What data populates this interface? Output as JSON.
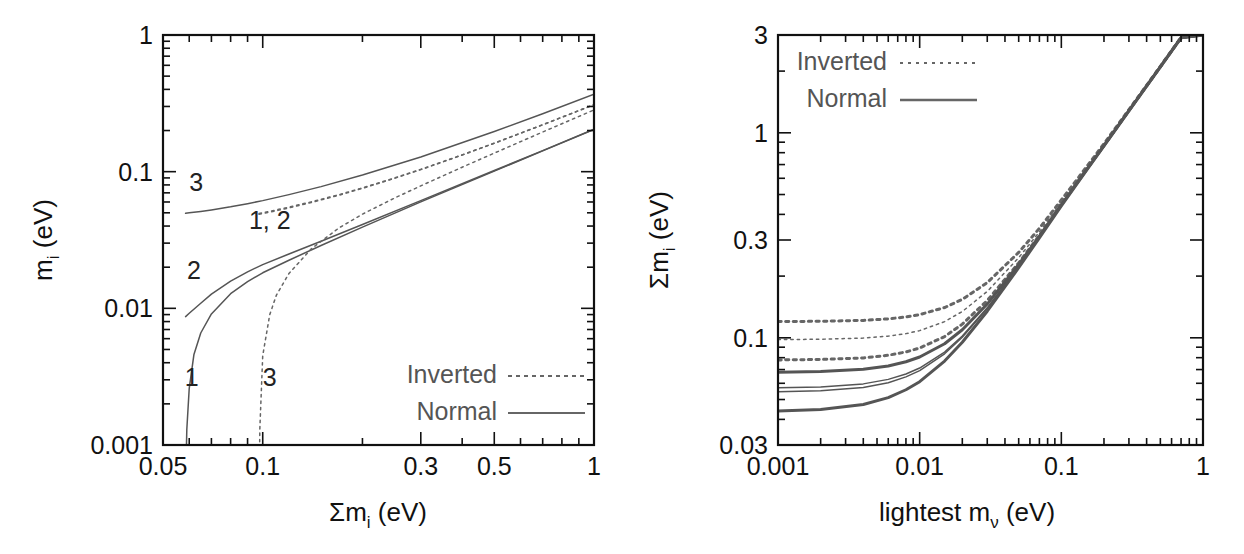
{
  "figure": {
    "background": "#ffffff",
    "panel_count": 2
  },
  "colors": {
    "axis": "#111111",
    "normal_curve": "#555555",
    "inverted_curve": "#666666",
    "legend_text": "#555555",
    "label_text": "#222222"
  },
  "left_panel": {
    "name": "individual-mass-vs-sum-plot",
    "xlabel": "Σm",
    "xlabel_sub": "i",
    "xlabel_unit": " (eV)",
    "ylabel": "m",
    "ylabel_sub": "i",
    "ylabel_unit": " (eV)",
    "x_ticks": [
      "0.05",
      "0.1",
      "0.3",
      "0.5",
      "1"
    ],
    "x_tick_values": [
      0.05,
      0.1,
      0.3,
      0.5,
      1
    ],
    "y_ticks": [
      "0.001",
      "0.01",
      "0.1",
      "1"
    ],
    "y_tick_values": [
      0.001,
      0.01,
      0.1,
      1
    ],
    "xlim": [
      0.05,
      1
    ],
    "ylim": [
      0.001,
      1
    ],
    "xscale": "log",
    "yscale": "log",
    "curve_annotations": [
      {
        "text": "3",
        "x": 0.063,
        "y": 0.072
      },
      {
        "text": "1, 2",
        "x": 0.105,
        "y": 0.038
      },
      {
        "text": "2",
        "x": 0.062,
        "y": 0.0165
      },
      {
        "text": "1",
        "x": 0.061,
        "y": 0.0027
      },
      {
        "text": "3",
        "x": 0.105,
        "y": 0.0027
      }
    ],
    "legend": {
      "items": [
        {
          "label": "Inverted",
          "style": "dotted"
        },
        {
          "label": "Normal",
          "style": "solid"
        }
      ]
    }
  },
  "right_panel": {
    "name": "sum-mass-vs-lightest-plot",
    "xlabel": "lightest m",
    "xlabel_sub": "ν",
    "xlabel_unit": " (eV)",
    "ylabel": "Σm",
    "ylabel_sub": "i",
    "ylabel_unit": " (eV)",
    "x_ticks": [
      "0.001",
      "0.01",
      "0.1",
      "1"
    ],
    "x_tick_values": [
      0.001,
      0.01,
      0.1,
      1
    ],
    "y_ticks": [
      "0.03",
      "0.1",
      "0.3",
      "1",
      "3"
    ],
    "y_tick_values": [
      0.03,
      0.1,
      0.3,
      1,
      3
    ],
    "xlim": [
      0.001,
      1
    ],
    "ylim": [
      0.03,
      3
    ],
    "xscale": "log",
    "yscale": "log",
    "legend": {
      "items": [
        {
          "label": "Inverted",
          "style": "dotted"
        },
        {
          "label": "Normal",
          "style": "solid"
        }
      ]
    }
  },
  "chart_data": [
    {
      "type": "line",
      "panel": "left",
      "title": "",
      "xlabel": "Σm_i (eV)",
      "ylabel": "m_i (eV)",
      "xscale": "log",
      "yscale": "log",
      "xlim": [
        0.05,
        1
      ],
      "ylim": [
        0.001,
        1
      ],
      "grid": false,
      "legend_position": "bottom-right",
      "annotations": [
        "3",
        "1, 2",
        "2",
        "1",
        "3"
      ],
      "series": [
        {
          "name": "Normal m1",
          "style": "solid",
          "label": "1",
          "x": [
            0.0585,
            0.059,
            0.06,
            0.062,
            0.065,
            0.07,
            0.08,
            0.09,
            0.1,
            0.12,
            0.15,
            0.2,
            0.3,
            0.5,
            0.7,
            1.0
          ],
          "y": [
            0.0005,
            0.0013,
            0.0026,
            0.0046,
            0.0066,
            0.0091,
            0.0128,
            0.0157,
            0.0182,
            0.0225,
            0.0288,
            0.0393,
            0.0601,
            0.101,
            0.142,
            0.204
          ]
        },
        {
          "name": "Normal m2",
          "style": "solid",
          "label": "2",
          "x": [
            0.0585,
            0.06,
            0.065,
            0.07,
            0.08,
            0.09,
            0.1,
            0.12,
            0.15,
            0.2,
            0.3,
            0.5,
            0.7,
            1.0
          ],
          "y": [
            0.0087,
            0.0092,
            0.0109,
            0.0127,
            0.0158,
            0.0185,
            0.0209,
            0.025,
            0.031,
            0.0411,
            0.0614,
            0.1019,
            0.1425,
            0.2043
          ]
        },
        {
          "name": "Normal m3",
          "style": "solid",
          "label": "3",
          "x": [
            0.0585,
            0.06,
            0.065,
            0.07,
            0.08,
            0.09,
            0.1,
            0.12,
            0.15,
            0.2,
            0.3,
            0.5,
            0.7,
            1.0
          ],
          "y": [
            0.0496,
            0.05,
            0.0512,
            0.0525,
            0.0553,
            0.0583,
            0.0614,
            0.0679,
            0.0777,
            0.0944,
            0.1282,
            0.1966,
            0.2653,
            0.3685
          ]
        },
        {
          "name": "Inverted m1",
          "style": "dotted",
          "label": "1",
          "x": [
            0.0975,
            0.1,
            0.11,
            0.12,
            0.14,
            0.17,
            0.2,
            0.25,
            0.3,
            0.4,
            0.5,
            0.7,
            1.0
          ],
          "y": [
            0.0488,
            0.0494,
            0.0518,
            0.0543,
            0.0594,
            0.0673,
            0.0755,
            0.0894,
            0.1035,
            0.1323,
            0.1614,
            0.2202,
            0.309
          ]
        },
        {
          "name": "Inverted m2",
          "style": "dotted",
          "label": "2",
          "x": [
            0.0975,
            0.1,
            0.11,
            0.12,
            0.14,
            0.17,
            0.2,
            0.25,
            0.3,
            0.4,
            0.5,
            0.7,
            1.0
          ],
          "y": [
            0.0495,
            0.0501,
            0.0525,
            0.055,
            0.0601,
            0.0679,
            0.0761,
            0.0899,
            0.1039,
            0.1327,
            0.1617,
            0.2204,
            0.3092
          ]
        },
        {
          "name": "Inverted m3",
          "style": "dotted",
          "label": "3",
          "x": [
            0.0975,
            0.098,
            0.1,
            0.105,
            0.11,
            0.12,
            0.14,
            0.17,
            0.2,
            0.25,
            0.3,
            0.4,
            0.5,
            0.7,
            1.0
          ],
          "y": [
            0.0004,
            0.0013,
            0.0045,
            0.009,
            0.0125,
            0.018,
            0.0272,
            0.0388,
            0.0489,
            0.0641,
            0.0787,
            0.1078,
            0.1367,
            0.195,
            0.283
          ]
        }
      ]
    },
    {
      "type": "line",
      "panel": "right",
      "title": "",
      "xlabel": "lightest m_ν (eV)",
      "ylabel": "Σm_i (eV)",
      "xscale": "log",
      "yscale": "log",
      "xlim": [
        0.001,
        1
      ],
      "ylim": [
        0.03,
        3
      ],
      "grid": false,
      "legend_position": "top-left",
      "series": [
        {
          "name": "Inverted upper",
          "style": "dotted",
          "weight": "thick",
          "x": [
            0.001,
            0.002,
            0.004,
            0.006,
            0.008,
            0.01,
            0.015,
            0.02,
            0.03,
            0.05,
            0.07,
            0.1,
            0.15,
            0.2,
            0.3,
            0.5,
            0.7,
            1.0
          ],
          "y": [
            0.12,
            0.1204,
            0.1216,
            0.1237,
            0.1264,
            0.1298,
            0.1405,
            0.154,
            0.186,
            0.261,
            0.342,
            0.47,
            0.68,
            0.885,
            1.298,
            2.11,
            2.92,
            3.0
          ]
        },
        {
          "name": "Inverted mid",
          "style": "dotted",
          "weight": "thin",
          "x": [
            0.001,
            0.002,
            0.004,
            0.006,
            0.008,
            0.01,
            0.015,
            0.02,
            0.03,
            0.05,
            0.07,
            0.1,
            0.15,
            0.2,
            0.3,
            0.5,
            0.7,
            1.0
          ],
          "y": [
            0.098,
            0.0984,
            0.0997,
            0.1019,
            0.1048,
            0.1084,
            0.1199,
            0.1344,
            0.1683,
            0.246,
            0.3285,
            0.458,
            0.669,
            0.876,
            1.29,
            2.103,
            2.915,
            3.0
          ]
        },
        {
          "name": "Inverted lower",
          "style": "dotted",
          "weight": "thick",
          "x": [
            0.001,
            0.002,
            0.004,
            0.006,
            0.008,
            0.01,
            0.015,
            0.02,
            0.03,
            0.05,
            0.07,
            0.1,
            0.15,
            0.2,
            0.3,
            0.5,
            0.7,
            1.0
          ],
          "y": [
            0.078,
            0.0784,
            0.0798,
            0.0822,
            0.0853,
            0.0892,
            0.1014,
            0.1166,
            0.152,
            0.232,
            0.316,
            0.447,
            0.66,
            0.868,
            1.284,
            2.098,
            2.91,
            3.0
          ]
        },
        {
          "name": "Normal upper",
          "style": "solid",
          "weight": "thick",
          "x": [
            0.001,
            0.002,
            0.004,
            0.006,
            0.008,
            0.01,
            0.015,
            0.02,
            0.03,
            0.05,
            0.07,
            0.1,
            0.15,
            0.2,
            0.3,
            0.5,
            0.7,
            1.0
          ],
          "y": [
            0.068,
            0.0685,
            0.0702,
            0.0729,
            0.0764,
            0.0806,
            0.0936,
            0.1095,
            0.1461,
            0.228,
            0.313,
            0.445,
            0.658,
            0.867,
            1.283,
            2.097,
            2.91,
            3.0
          ]
        },
        {
          "name": "Normal mid-upper",
          "style": "solid",
          "weight": "thin",
          "x": [
            0.001,
            0.002,
            0.004,
            0.006,
            0.008,
            0.01,
            0.015,
            0.02,
            0.03,
            0.05,
            0.07,
            0.1,
            0.15,
            0.2,
            0.3,
            0.5,
            0.7,
            1.0
          ],
          "y": [
            0.057,
            0.0576,
            0.0596,
            0.0627,
            0.0666,
            0.0712,
            0.0852,
            0.102,
            0.14,
            0.2235,
            0.3095,
            0.442,
            0.656,
            0.865,
            1.282,
            2.096,
            2.909,
            3.0
          ]
        },
        {
          "name": "Normal mid-lower",
          "style": "solid",
          "weight": "thin",
          "x": [
            0.001,
            0.002,
            0.004,
            0.006,
            0.008,
            0.01,
            0.015,
            0.02,
            0.03,
            0.05,
            0.07,
            0.1,
            0.15,
            0.2,
            0.3,
            0.5,
            0.7,
            1.0
          ],
          "y": [
            0.0545,
            0.0551,
            0.0572,
            0.0604,
            0.0645,
            0.0692,
            0.0836,
            0.1006,
            0.1389,
            0.2227,
            0.3089,
            0.4415,
            0.6555,
            0.8645,
            1.2815,
            2.0955,
            2.9085,
            3.0
          ]
        },
        {
          "name": "Normal lower",
          "style": "solid",
          "weight": "thick",
          "x": [
            0.001,
            0.002,
            0.004,
            0.006,
            0.008,
            0.01,
            0.015,
            0.02,
            0.03,
            0.05,
            0.07,
            0.1,
            0.15,
            0.2,
            0.3,
            0.5,
            0.7,
            1.0
          ],
          "y": [
            0.044,
            0.0447,
            0.0473,
            0.0511,
            0.0558,
            0.0611,
            0.077,
            0.0952,
            0.1348,
            0.22,
            0.307,
            0.44,
            0.654,
            0.8635,
            1.281,
            2.095,
            2.908,
            3.0
          ]
        }
      ]
    }
  ]
}
